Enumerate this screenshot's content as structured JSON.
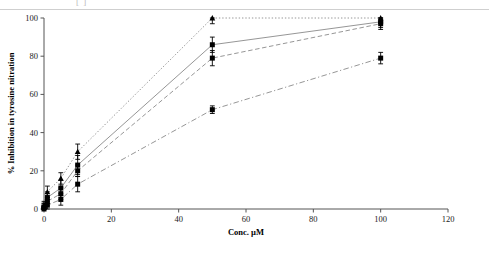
{
  "header": {
    "left_fragment": "[ ]",
    "right_fragment": "",
    "note": "cropped text row at top of image"
  },
  "chart_data": {
    "type": "line",
    "title": "",
    "xlabel": "Conc. µM",
    "ylabel": "% Inhibition in tyrosine nitration",
    "xlim": [
      0,
      120
    ],
    "ylim": [
      0,
      100
    ],
    "xticks": [
      0,
      20,
      40,
      60,
      80,
      100,
      120
    ],
    "yticks": [
      0,
      20,
      40,
      60,
      80,
      100
    ],
    "grid": false,
    "legend": "none",
    "x": [
      0,
      1,
      5,
      10,
      50,
      100
    ],
    "series": [
      {
        "name": "series-1",
        "linestyle": "dotted",
        "marker": "triangle",
        "values": [
          2,
          9,
          16,
          30,
          100,
          100
        ],
        "errors": [
          2,
          3,
          3,
          4,
          3,
          2
        ]
      },
      {
        "name": "series-2",
        "linestyle": "solid",
        "marker": "square",
        "values": [
          1,
          6,
          11,
          23,
          86,
          98
        ],
        "errors": [
          2,
          3,
          4,
          5,
          4,
          3
        ]
      },
      {
        "name": "series-3",
        "linestyle": "dashed",
        "marker": "square",
        "values": [
          1,
          4,
          8,
          20,
          79,
          97
        ],
        "errors": [
          2,
          2,
          3,
          3,
          4,
          3
        ]
      },
      {
        "name": "series-4",
        "linestyle": "dashdot",
        "marker": "square",
        "values": [
          0,
          2,
          5,
          13,
          52,
          79
        ],
        "errors": [
          1,
          2,
          3,
          4,
          2,
          3
        ]
      }
    ]
  }
}
